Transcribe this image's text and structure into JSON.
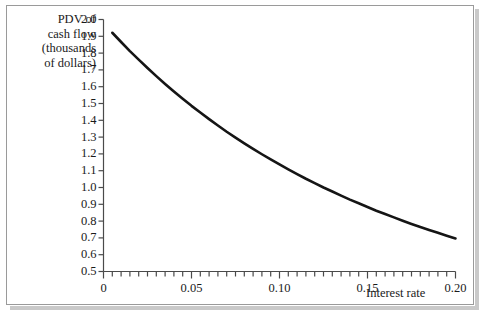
{
  "figure": {
    "border_color": "#9a9a9a",
    "shadow_color": "#c9c9c9",
    "background": "#ffffff",
    "curve_color": "#151515",
    "axis_color": "#4a4a4a"
  },
  "chart_data": {
    "type": "line",
    "title": "",
    "subtitle": "",
    "xlabel": "Interest rate",
    "ylabel": "PDV of cash flow (thousands of dollars)",
    "ylabel_lines": [
      "PDV of",
      "cash flow",
      "(thousands",
      "of dollars)"
    ],
    "xlim": [
      0.0,
      0.2
    ],
    "ylim": [
      0.5,
      2.0
    ],
    "grid": false,
    "legend": null,
    "x_ticks_major": [
      0.0,
      0.05,
      0.1,
      0.15,
      0.2
    ],
    "x_tick_labels": [
      "0",
      "0.05",
      "0.10",
      "0.15",
      "0.20"
    ],
    "x_tick_minor_step": 0.005,
    "y_ticks": [
      0.5,
      0.6,
      0.7,
      0.8,
      0.9,
      1.0,
      1.1,
      1.2,
      1.3,
      1.4,
      1.5,
      1.6,
      1.7,
      1.8,
      1.9,
      2.0
    ],
    "y_tick_labels": [
      "0.5",
      "0.6",
      "0.7",
      "0.8",
      "0.9",
      "1.0",
      "1.1",
      "1.2",
      "1.3",
      "1.4",
      "1.5",
      "1.6",
      "1.7",
      "1.8",
      "1.9",
      "2.0"
    ],
    "series": [
      {
        "name": "PDV",
        "x": [
          0.005,
          0.01,
          0.015,
          0.02,
          0.025,
          0.03,
          0.035,
          0.04,
          0.045,
          0.05,
          0.055,
          0.06,
          0.065,
          0.07,
          0.075,
          0.08,
          0.085,
          0.09,
          0.095,
          0.1,
          0.105,
          0.11,
          0.115,
          0.12,
          0.125,
          0.13,
          0.135,
          0.14,
          0.145,
          0.15,
          0.155,
          0.16,
          0.165,
          0.17,
          0.175,
          0.18,
          0.185,
          0.19,
          0.195,
          0.2
        ],
        "values": [
          1.921,
          1.866,
          1.812,
          1.761,
          1.711,
          1.663,
          1.616,
          1.571,
          1.528,
          1.486,
          1.446,
          1.407,
          1.369,
          1.332,
          1.297,
          1.263,
          1.23,
          1.198,
          1.167,
          1.137,
          1.108,
          1.08,
          1.052,
          1.026,
          1.0,
          0.976,
          0.952,
          0.928,
          0.906,
          0.884,
          0.862,
          0.842,
          0.822,
          0.802,
          0.783,
          0.765,
          0.747,
          0.73,
          0.713,
          0.697
        ]
      }
    ]
  }
}
